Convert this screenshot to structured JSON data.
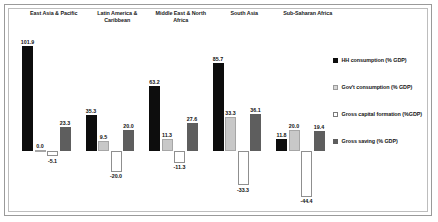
{
  "chart_data": {
    "type": "bar",
    "title": "",
    "xlabel": "",
    "ylabel": "",
    "grid": false,
    "legend_position": "right",
    "categories": [
      "East Asia & Pacific",
      "Latin America & Caribbean",
      "Middle East & North Africa",
      "South Asia",
      "Sub-Saharan Africa"
    ],
    "series": [
      {
        "name": "HH consumption (% GDP)",
        "color": "#0d0d0d",
        "values": [
          101.9,
          35.3,
          63.2,
          85.7,
          11.8
        ]
      },
      {
        "name": "Gov't consumption (% GDP)",
        "color": "#c8c8c8",
        "values": [
          0.0,
          9.5,
          11.3,
          33.3,
          20.0
        ]
      },
      {
        "name": "Gross capital formation (%GDP)",
        "color": "#ffffff",
        "values": [
          -5.1,
          -20.0,
          -11.3,
          -33.3,
          -44.4
        ]
      },
      {
        "name": "Gross saving (% GDP)",
        "color": "#5e5e5e",
        "values": [
          23.3,
          20.0,
          27.6,
          36.1,
          19.4
        ]
      }
    ],
    "value_labels": [
      [
        "101.9",
        "0.0",
        "-5.1",
        "23.3"
      ],
      [
        "35.3",
        "9.5",
        "-20.0",
        "20.0"
      ],
      [
        "63.2",
        "11.3",
        "-11.3",
        "27.6"
      ],
      [
        "85.7",
        "33.3",
        "-33.3",
        "36.1"
      ],
      [
        "11.8",
        "20.0",
        "-44.4",
        "19.4"
      ]
    ],
    "ylim": [
      -50,
      110
    ]
  }
}
